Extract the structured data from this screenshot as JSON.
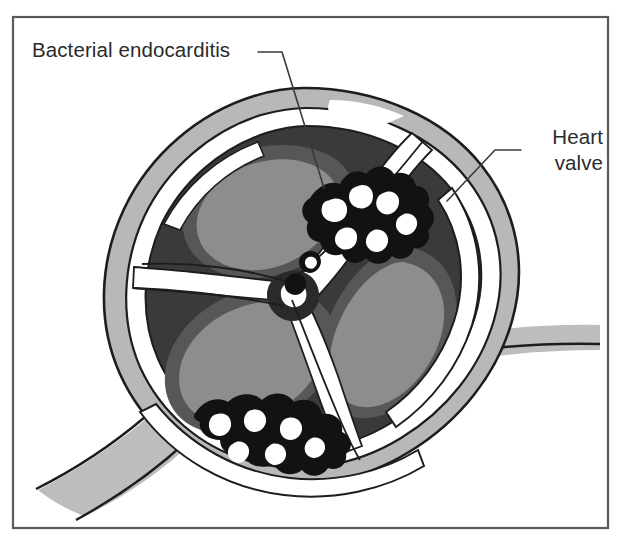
{
  "figure": {
    "frame": {
      "name": "figure-border",
      "x": 13,
      "y": 17,
      "width": 595,
      "height": 511,
      "stroke_color": "#5a5a5a"
    },
    "background_color": "#ffffff"
  },
  "labels": [
    {
      "id": "bacterial-endocarditis",
      "text": "Bacterial endocarditis",
      "x": 32,
      "y": 57,
      "anchor": "start",
      "lines": [
        "Bacterial endocarditis"
      ]
    },
    {
      "id": "heart-valve",
      "text": "Heart valve",
      "x": 603,
      "y": 144,
      "anchor": "end",
      "lines": [
        "Heart",
        "valve"
      ]
    }
  ],
  "leader_lines": [
    {
      "id": "leader-bacterial-endocarditis",
      "points": "258,52 282,52 324,188"
    },
    {
      "id": "leader-heart-valve",
      "points": "521,150 495,150 447,201"
    }
  ],
  "palette": {
    "outline": "#1d1d1d",
    "vessel_light_gray": "#bdbdbd",
    "wall_light_gray": "#b8b8b8",
    "lumen_dark": "#3a3a3a",
    "cusp_shadow_gray": "#575757",
    "cusp_gray": "#8d8d8d",
    "vegetation_black": "#121212",
    "highlight_white": "#ffffff",
    "label_ink": "#2b2b2b",
    "frame_gray": "#5a5a5a"
  },
  "anatomy": {
    "parts": [
      {
        "name": "aortic-wall-outer-ring",
        "color": "#b8b8b8",
        "description": "Light gray vessel wall ring surrounding the valve opening"
      },
      {
        "name": "wall-white-band",
        "color": "#ffffff",
        "description": "White band inside the outer wall ring"
      },
      {
        "name": "valve-lumen",
        "color": "#3a3a3a",
        "description": "Dark interior of the valve orifice"
      },
      {
        "name": "valve-cusp-upper-left",
        "color": "#8d8d8d",
        "description": "Upper-left semilunar cusp"
      },
      {
        "name": "valve-cusp-lower-left",
        "color": "#8d8d8d",
        "description": "Lower-left semilunar cusp"
      },
      {
        "name": "valve-cusp-right",
        "color": "#8d8d8d",
        "description": "Right semilunar cusp"
      },
      {
        "name": "vegetation-upper",
        "color": "#121212",
        "description": "Bacterial vegetation cluster along the upper-right cusp margin"
      },
      {
        "name": "vegetation-lower",
        "color": "#121212",
        "description": "Bacterial vegetation cluster along the lower cusp margin"
      },
      {
        "name": "vessel-branch-lower-left",
        "color": "#bdbdbd",
        "description": "Vessel branch extending to the lower left"
      },
      {
        "name": "vessel-branch-right",
        "color": "#bdbdbd",
        "description": "Vessel band extending to the right"
      },
      {
        "name": "wall-highlight-top-right",
        "color": "#ffffff",
        "description": "White specular highlight on the upper-right wall"
      }
    ]
  }
}
